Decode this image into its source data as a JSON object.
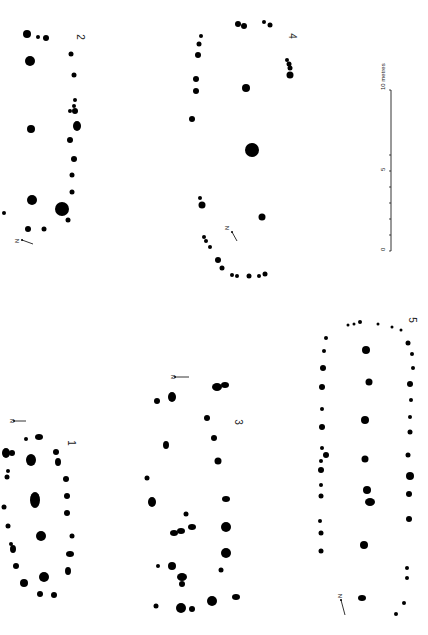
{
  "figure": {
    "background": "#ffffff",
    "ink": "#000000"
  },
  "scale_bar": {
    "labels": [
      "0",
      "5",
      "10 metres"
    ],
    "x": 391,
    "y0": 251,
    "y1": 90,
    "ticks_y": [
      251,
      235,
      219,
      203,
      187,
      171,
      155
    ]
  },
  "plans": [
    {
      "id": "1",
      "label": "1",
      "label_pos": [
        68,
        443
      ],
      "north": {
        "text": "N",
        "x": 10,
        "y": 421,
        "arrow": [
          [
            14,
            421
          ],
          [
            26,
            421
          ]
        ]
      },
      "posts": [
        [
          12,
          453,
          3
        ],
        [
          26,
          439,
          2
        ],
        [
          39,
          437,
          4,
          3
        ],
        [
          56,
          452,
          3
        ],
        [
          58,
          462,
          3,
          4
        ],
        [
          6,
          453,
          4,
          5
        ],
        [
          31,
          460,
          5,
          6
        ],
        [
          8,
          471,
          2
        ],
        [
          7,
          477,
          2.5
        ],
        [
          66,
          479,
          3
        ],
        [
          4,
          507,
          2.5
        ],
        [
          67,
          496,
          3
        ],
        [
          35,
          500,
          5,
          8
        ],
        [
          67,
          513,
          3
        ],
        [
          8,
          526,
          2.5
        ],
        [
          72,
          536,
          2.5
        ],
        [
          11,
          544,
          2
        ],
        [
          13,
          549,
          3,
          4
        ],
        [
          41,
          536,
          5,
          5
        ],
        [
          70,
          554,
          4,
          3
        ],
        [
          16,
          566,
          3
        ],
        [
          68,
          571,
          3,
          4
        ],
        [
          24,
          583,
          4
        ],
        [
          44,
          577,
          5,
          5
        ],
        [
          40,
          594,
          3
        ],
        [
          54,
          595,
          3
        ]
      ]
    },
    {
      "id": "2",
      "label": "2",
      "label_pos": [
        77,
        37
      ],
      "north": {
        "text": "N",
        "x": 15,
        "y": 241,
        "arrow": [
          [
            22,
            240
          ],
          [
            33,
            244
          ]
        ]
      },
      "posts": [
        [
          27,
          34,
          4
        ],
        [
          38,
          37,
          2
        ],
        [
          46,
          38,
          3
        ],
        [
          30,
          61,
          5
        ],
        [
          71,
          54,
          2.5
        ],
        [
          74,
          75,
          2.5
        ],
        [
          75,
          100,
          2
        ],
        [
          74,
          106,
          2
        ],
        [
          70,
          111,
          2
        ],
        [
          75,
          111,
          3
        ],
        [
          77,
          126,
          4,
          5
        ],
        [
          31,
          129,
          4
        ],
        [
          70,
          140,
          3
        ],
        [
          74,
          159,
          3
        ],
        [
          72,
          175,
          2.5
        ],
        [
          72,
          192,
          2.5
        ],
        [
          32,
          200,
          5
        ],
        [
          62,
          209,
          7
        ],
        [
          4,
          213,
          2
        ],
        [
          68,
          220,
          2.5
        ],
        [
          28,
          229,
          3
        ],
        [
          44,
          229,
          2.5
        ]
      ]
    },
    {
      "id": "3",
      "label": "3",
      "label_pos": [
        235,
        422
      ],
      "north": {
        "text": "N",
        "x": 171,
        "y": 377,
        "arrow": [
          [
            175,
            377
          ],
          [
            189,
            377
          ]
        ]
      },
      "posts": [
        [
          217,
          387,
          5,
          4
        ],
        [
          225,
          385,
          4,
          3
        ],
        [
          157,
          401,
          3
        ],
        [
          172,
          397,
          4,
          5
        ],
        [
          207,
          418,
          3
        ],
        [
          214,
          438,
          3
        ],
        [
          166,
          445,
          3,
          4
        ],
        [
          218,
          461,
          3.5
        ],
        [
          147,
          478,
          2.5
        ],
        [
          152,
          502,
          4,
          5
        ],
        [
          226,
          499,
          4,
          3
        ],
        [
          186,
          514,
          2.5
        ],
        [
          226,
          527,
          5
        ],
        [
          181,
          531,
          4,
          3
        ],
        [
          192,
          527,
          4,
          3
        ],
        [
          174,
          533,
          4,
          3
        ],
        [
          158,
          566,
          2
        ],
        [
          172,
          566,
          4
        ],
        [
          226,
          553,
          5
        ],
        [
          221,
          570,
          2.5
        ],
        [
          182,
          577,
          5,
          4
        ],
        [
          236,
          597,
          4,
          3
        ],
        [
          156,
          606,
          2.5
        ],
        [
          212,
          601,
          5
        ],
        [
          181,
          608,
          5
        ],
        [
          192,
          609,
          3
        ],
        [
          182,
          584,
          3,
          3
        ]
      ]
    },
    {
      "id": "4",
      "label": "4",
      "label_pos": [
        289,
        36
      ],
      "north": {
        "text": "N",
        "x": 225,
        "y": 228,
        "arrow": [
          [
            232,
            232
          ],
          [
            237,
            241
          ]
        ]
      },
      "posts": [
        [
          238,
          24,
          3
        ],
        [
          244,
          26,
          3
        ],
        [
          264,
          22,
          2
        ],
        [
          270,
          25,
          2.5
        ],
        [
          201,
          36,
          2
        ],
        [
          199,
          44,
          2.5
        ],
        [
          198,
          55,
          3
        ],
        [
          196,
          79,
          3
        ],
        [
          196,
          91,
          3
        ],
        [
          246,
          88,
          4
        ],
        [
          192,
          119,
          3
        ],
        [
          252,
          150,
          7
        ],
        [
          287,
          60,
          2
        ],
        [
          289,
          64,
          2.5
        ],
        [
          290,
          68,
          2.5
        ],
        [
          290,
          75,
          3.5
        ],
        [
          200,
          198,
          2
        ],
        [
          202,
          205,
          3.5
        ],
        [
          262,
          217,
          3.5
        ],
        [
          204,
          237,
          2
        ],
        [
          206,
          241,
          2
        ],
        [
          210,
          247,
          2
        ],
        [
          218,
          260,
          3
        ],
        [
          222,
          268,
          2.5
        ],
        [
          232,
          275,
          2
        ],
        [
          237,
          276,
          2
        ],
        [
          249,
          276,
          2.5
        ],
        [
          259,
          276,
          2
        ],
        [
          265,
          274,
          2.5
        ]
      ]
    },
    {
      "id": "5",
      "label": "5",
      "label_pos": [
        409,
        320
      ],
      "north": {
        "text": "N",
        "x": 338,
        "y": 596,
        "arrow": [
          [
            341,
            600
          ],
          [
            345,
            615
          ]
        ]
      },
      "posts": [
        [
          348,
          325,
          1.5
        ],
        [
          354,
          324,
          1.5
        ],
        [
          360,
          322,
          2
        ],
        [
          378,
          324,
          1.5
        ],
        [
          392,
          327,
          1.5
        ],
        [
          401,
          330,
          1.5
        ],
        [
          326,
          338,
          2
        ],
        [
          324,
          351,
          2
        ],
        [
          323,
          368,
          3
        ],
        [
          322,
          387,
          3
        ],
        [
          322,
          409,
          2
        ],
        [
          322,
          427,
          3
        ],
        [
          322,
          448,
          2
        ],
        [
          326,
          455,
          3
        ],
        [
          321,
          461,
          2
        ],
        [
          321,
          470,
          3
        ],
        [
          321,
          485,
          2
        ],
        [
          321,
          496,
          2.5
        ],
        [
          320,
          521,
          2
        ],
        [
          321,
          533,
          2.5
        ],
        [
          321,
          551,
          2.5
        ],
        [
          366,
          350,
          4
        ],
        [
          369,
          382,
          3.5
        ],
        [
          365,
          420,
          4,
          4
        ],
        [
          365,
          459,
          3.5
        ],
        [
          367,
          490,
          4
        ],
        [
          370,
          502,
          5,
          4
        ],
        [
          364,
          545,
          4,
          4
        ],
        [
          408,
          343,
          2.5
        ],
        [
          412,
          354,
          2
        ],
        [
          413,
          368,
          2
        ],
        [
          410,
          384,
          3
        ],
        [
          411,
          400,
          2
        ],
        [
          410,
          417,
          2
        ],
        [
          410,
          432,
          2.5
        ],
        [
          408,
          455,
          2.5
        ],
        [
          410,
          476,
          4
        ],
        [
          409,
          494,
          3
        ],
        [
          409,
          519,
          3
        ],
        [
          407,
          568,
          2
        ],
        [
          407,
          578,
          2
        ],
        [
          362,
          598,
          4,
          3
        ],
        [
          404,
          603,
          2
        ],
        [
          396,
          614,
          2
        ]
      ]
    }
  ]
}
